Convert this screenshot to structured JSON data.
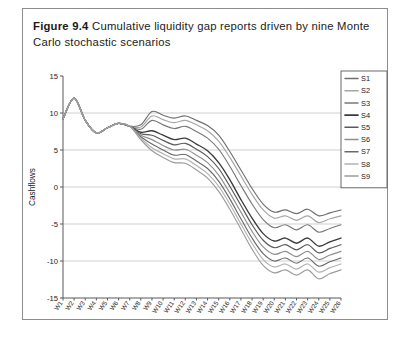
{
  "caption": {
    "figure_number": "Figure 9.4",
    "text": "Cumulative liquidity gap reports driven by nine Monte Carlo stochastic scenarios"
  },
  "chart_data": {
    "type": "line",
    "title": "",
    "xlabel": "Time periods",
    "ylabel": "Cashflows",
    "ylim": [
      -15,
      15
    ],
    "yticks": [
      15,
      10,
      5,
      0,
      -5,
      -10,
      -15
    ],
    "ytick_labels": [
      "15",
      "10",
      "5",
      "0",
      "-5",
      "-10",
      "-15"
    ],
    "grid": true,
    "grid_axis": "y",
    "legend_position": "top-right",
    "x": [
      "W1",
      "W2",
      "W3",
      "W4",
      "W5",
      "W6",
      "W7",
      "W8",
      "W9",
      "W10",
      "W11",
      "W12",
      "W13",
      "W14",
      "W15",
      "W16",
      "W17",
      "W18",
      "W19",
      "W20",
      "W21",
      "W22",
      "W23",
      "W24",
      "W25",
      "W26"
    ],
    "series": [
      {
        "name": "S1",
        "color": "#6f6f6f",
        "width": 1.15,
        "values": [
          9.2,
          12.0,
          9.0,
          7.3,
          8.0,
          8.6,
          8.2,
          8.4,
          10.2,
          9.7,
          9.3,
          9.6,
          9.0,
          8.3,
          7.0,
          4.8,
          2.3,
          -0.2,
          -2.3,
          -3.4,
          -3.1,
          -3.6,
          -3.0,
          -3.9,
          -3.5,
          -3.1
        ]
      },
      {
        "name": "S2",
        "color": "#a6a6a6",
        "width": 1.15,
        "values": [
          9.2,
          12.0,
          9.0,
          7.3,
          8.0,
          8.6,
          8.2,
          8.1,
          9.6,
          9.1,
          8.7,
          9.0,
          8.4,
          7.6,
          6.2,
          4.0,
          1.5,
          -1.0,
          -3.1,
          -4.2,
          -3.9,
          -4.5,
          -3.9,
          -4.8,
          -4.3,
          -3.9
        ]
      },
      {
        "name": "S3",
        "color": "#787878",
        "width": 1.15,
        "values": [
          9.2,
          12.0,
          9.0,
          7.3,
          8.0,
          8.6,
          8.2,
          7.8,
          9.0,
          8.4,
          7.9,
          8.2,
          7.5,
          6.6,
          5.1,
          2.8,
          0.2,
          -2.3,
          -4.4,
          -5.5,
          -5.1,
          -5.8,
          -5.1,
          -6.1,
          -5.6,
          -5.1
        ]
      },
      {
        "name": "S4",
        "color": "#3b3b3b",
        "width": 1.35,
        "values": [
          9.2,
          12.0,
          9.0,
          7.3,
          8.0,
          8.6,
          8.2,
          7.4,
          7.6,
          7.0,
          6.4,
          6.6,
          5.8,
          4.9,
          3.3,
          1.0,
          -1.7,
          -4.2,
          -6.3,
          -7.3,
          -6.9,
          -7.6,
          -6.9,
          -8.0,
          -7.4,
          -6.9
        ]
      },
      {
        "name": "S5",
        "color": "#5a5a5a",
        "width": 1.2,
        "values": [
          9.2,
          12.0,
          9.0,
          7.3,
          8.0,
          8.6,
          8.2,
          7.2,
          7.0,
          6.3,
          5.7,
          5.9,
          5.1,
          4.1,
          2.5,
          0.1,
          -2.5,
          -5.1,
          -7.2,
          -8.2,
          -7.8,
          -8.5,
          -7.8,
          -8.9,
          -8.3,
          -7.8
        ]
      },
      {
        "name": "S6",
        "color": "#8f8f8f",
        "width": 1.15,
        "values": [
          9.2,
          12.0,
          9.0,
          7.3,
          8.0,
          8.6,
          8.2,
          7.0,
          6.4,
          5.6,
          5.0,
          5.1,
          4.3,
          3.3,
          1.6,
          -0.8,
          -3.4,
          -6.0,
          -8.1,
          -9.1,
          -8.7,
          -9.4,
          -8.7,
          -9.8,
          -9.2,
          -8.7
        ]
      },
      {
        "name": "S7",
        "color": "#6a6a6a",
        "width": 1.15,
        "values": [
          9.2,
          12.0,
          9.0,
          7.3,
          8.0,
          8.6,
          8.2,
          6.8,
          5.8,
          5.0,
          4.3,
          4.4,
          3.5,
          2.5,
          0.8,
          -1.6,
          -4.3,
          -6.9,
          -9.0,
          -10.0,
          -9.6,
          -10.3,
          -9.6,
          -10.7,
          -10.1,
          -9.6
        ]
      },
      {
        "name": "S8",
        "color": "#b2b2b2",
        "width": 1.15,
        "values": [
          9.2,
          12.0,
          9.0,
          7.3,
          8.0,
          8.6,
          8.2,
          6.6,
          5.3,
          4.5,
          3.8,
          3.8,
          2.9,
          1.8,
          0.1,
          -2.3,
          -5.0,
          -7.6,
          -9.8,
          -10.8,
          -10.4,
          -11.1,
          -10.4,
          -11.5,
          -10.9,
          -10.4
        ]
      },
      {
        "name": "S9",
        "color": "#9c9c9c",
        "width": 1.15,
        "values": [
          9.2,
          12.0,
          9.0,
          7.3,
          8.0,
          8.6,
          8.2,
          6.4,
          4.9,
          4.0,
          3.3,
          3.2,
          2.3,
          1.2,
          -0.6,
          -3.0,
          -5.7,
          -8.4,
          -10.6,
          -11.6,
          -11.2,
          -11.9,
          -11.2,
          -12.4,
          -11.7,
          -11.2
        ]
      }
    ]
  }
}
